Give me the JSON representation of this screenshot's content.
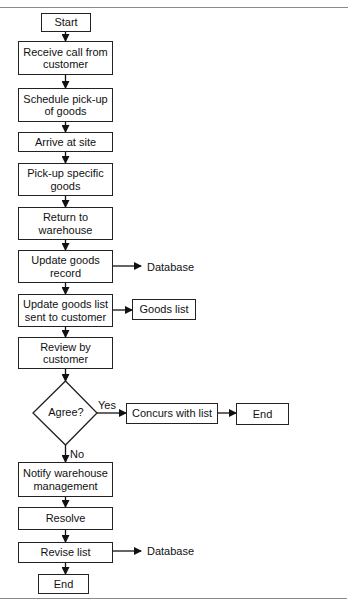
{
  "diagram": {
    "type": "flowchart",
    "nodes": {
      "start": "Start",
      "receive": "Receive call from customer",
      "schedule": "Schedule pick-up of goods",
      "arrive": "Arrive at site",
      "pickup": "Pick-up specific goods",
      "return": "Return to warehouse",
      "update_record": "Update goods record",
      "update_list": "Update goods list sent to customer",
      "review": "Review by customer",
      "decision": "Agree?",
      "concurs": "Concurs with list",
      "end_right": "End",
      "notify": "Notify warehouse management",
      "resolve": "Resolve",
      "revise": "Revise list",
      "end_bottom": "End"
    },
    "outputs": {
      "database_1": "Database",
      "goods_list": "Goods list",
      "database_2": "Database"
    },
    "edge_labels": {
      "yes": "Yes",
      "no": "No"
    },
    "colors": {
      "stroke": "#222222",
      "rule": "#8a8a8a",
      "background": "#ffffff"
    }
  }
}
